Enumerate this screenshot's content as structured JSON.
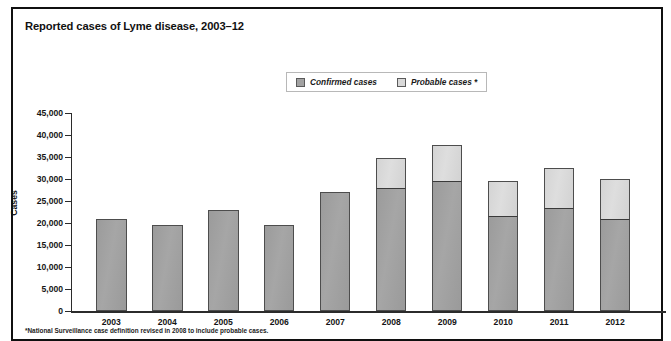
{
  "chart": {
    "title": "Reported cases of Lyme disease, 2003–12",
    "footnote": "*National Surveillance case definition revised in 2008 to include probable cases."
  },
  "legend": {
    "items": [
      {
        "label": "Confirmed cases",
        "icon": "square-swatch-icon",
        "color": "#a2a2a2"
      },
      {
        "label": "Probable cases *",
        "icon": "square-swatch-icon",
        "color": "#d6d6d6"
      }
    ]
  },
  "chart_data": {
    "type": "bar",
    "stacked": true,
    "title": "Reported cases of Lyme disease, 2003–12",
    "subtitle": "",
    "xlabel": "",
    "ylabel": "Cases",
    "ylim": [
      0,
      45000
    ],
    "ytick_labels": [
      "45,000",
      "40,000",
      "35,000",
      "30,000",
      "25,000",
      "20,000",
      "15,000",
      "10,000",
      "5,000",
      "0"
    ],
    "ytick_values": [
      45000,
      40000,
      35000,
      30000,
      25000,
      20000,
      15000,
      10000,
      5000,
      0
    ],
    "grid": false,
    "legend_position": "top-center",
    "categories": [
      "2003",
      "2004",
      "2005",
      "2006",
      "2007",
      "2008",
      "2009",
      "2010",
      "2011",
      "2012"
    ],
    "series": [
      {
        "name": "Confirmed cases",
        "color": "#a2a2a2",
        "values": [
          21000,
          19500,
          23000,
          19500,
          27000,
          28000,
          29500,
          21500,
          23500,
          21000
        ]
      },
      {
        "name": "Probable cases *",
        "color": "#d6d6d6",
        "values": [
          0,
          0,
          0,
          0,
          0,
          6700,
          8200,
          8000,
          9000,
          9000
        ]
      }
    ],
    "totals": [
      21000,
      19500,
      23000,
      19500,
      27000,
      34700,
      37700,
      29500,
      32500,
      30000
    ],
    "annotations": [
      "*National Surveillance case definition revised in 2008 to include probable cases."
    ]
  }
}
